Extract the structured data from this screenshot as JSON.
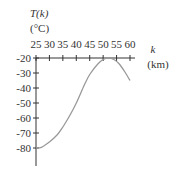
{
  "chart_data": {
    "type": "line",
    "title": "",
    "ylabel_line1": "T(k)",
    "ylabel_line2": "(°C)",
    "xlabel_line1": "k",
    "xlabel_line2": "(km)",
    "x_ticks": [
      25,
      30,
      35,
      40,
      45,
      50,
      55,
      60
    ],
    "y_ticks": [
      -20,
      -30,
      -40,
      -50,
      -60,
      -70,
      -80
    ],
    "xlim": [
      25,
      60
    ],
    "ylim": [
      -85,
      -20
    ],
    "grid": false,
    "legend": "none",
    "series": [
      {
        "name": "T(k)",
        "color": "#999999",
        "x": [
          25,
          27,
          30,
          33,
          35,
          38,
          40,
          43,
          45,
          48,
          50,
          52,
          54,
          56,
          58,
          60
        ],
        "y": [
          -80,
          -79.5,
          -76,
          -71,
          -66,
          -57,
          -50,
          -38,
          -31,
          -24,
          -21,
          -20,
          -21,
          -24,
          -29,
          -35
        ]
      }
    ]
  }
}
